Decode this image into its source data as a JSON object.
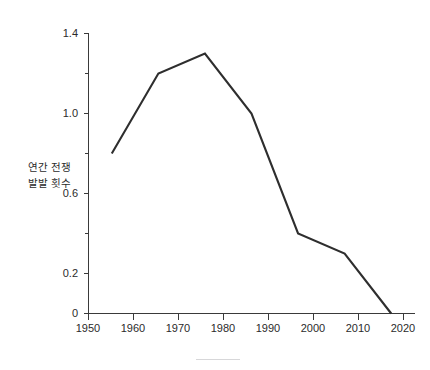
{
  "chart_data": {
    "type": "line",
    "title": "",
    "subtitle": "",
    "xlabel": "",
    "ylabel_lines": [
      "연간 전쟁",
      "발발 횟수"
    ],
    "ylabel": "연간 전쟁 발발 횟수",
    "x": [
      1955,
      1965,
      1975,
      1985,
      1995,
      2005,
      2015
    ],
    "values": [
      0.8,
      1.2,
      1.3,
      1.0,
      0.4,
      0.3,
      0.0
    ],
    "series": [
      {
        "name": "연간 전쟁 발발 횟수",
        "values": [
          0.8,
          1.2,
          1.3,
          1.0,
          0.4,
          0.3,
          0.0
        ],
        "color": "#2e2e2e"
      }
    ],
    "xlim": [
      1950,
      2020
    ],
    "ylim": [
      0,
      1.4
    ],
    "x_ticks": [
      1950,
      1960,
      1970,
      1980,
      1990,
      2000,
      2010,
      2020
    ],
    "x_tick_labels": [
      "1950",
      "1960",
      "1970",
      "1980",
      "1990",
      "2000",
      "2010",
      "2020"
    ],
    "y_ticks": [
      0,
      0.2,
      0.6,
      1.0,
      1.4
    ],
    "y_tick_labels": [
      "0",
      "0.2",
      "0.6",
      "1.0",
      "1.4"
    ],
    "y_minor_ticks": [
      0.4,
      0.8,
      1.2
    ],
    "grid": false,
    "legend": false,
    "legend_position": "none",
    "annotations": []
  },
  "axis_labels": {
    "y_line1": "연간 전쟁",
    "y_line2": "발발 횟수"
  },
  "x_tick_labels": {
    "t0": "1950",
    "t1": "1960",
    "t2": "1970",
    "t3": "1980",
    "t4": "1990",
    "t5": "2000",
    "t6": "2010",
    "t7": "2020"
  },
  "y_tick_labels": {
    "t0": "0",
    "t1": "0.2",
    "t2": "0.6",
    "t3": "1.0",
    "t4": "1.4"
  },
  "colors": {
    "line": "#2e2e2e",
    "axis": "#3a3a3a",
    "text": "#2b2b2b",
    "background": "#ffffff",
    "footer_rule": "#d7d7d9"
  }
}
